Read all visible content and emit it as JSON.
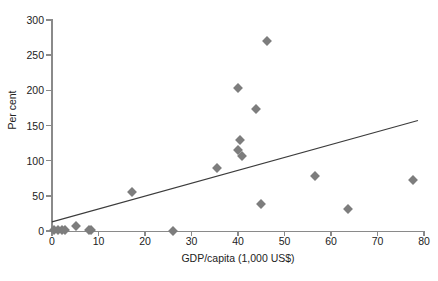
{
  "chart_data": {
    "type": "scatter",
    "title": "",
    "xlabel": "GDP/capita (1,000 US$)",
    "ylabel": "Per cent",
    "xlim": [
      0,
      80
    ],
    "ylim": [
      0,
      300
    ],
    "xticks": [
      0,
      10,
      20,
      30,
      40,
      50,
      60,
      70,
      80
    ],
    "yticks": [
      0,
      50,
      100,
      150,
      200,
      250,
      300
    ],
    "grid": false,
    "legend": "none",
    "marker_shape": "diamond",
    "marker_color": "#7d7d7d",
    "points": [
      {
        "x": 0.5,
        "y": 1
      },
      {
        "x": 1.2,
        "y": 1
      },
      {
        "x": 2.2,
        "y": 2
      },
      {
        "x": 2.8,
        "y": 2
      },
      {
        "x": 5.1,
        "y": 7
      },
      {
        "x": 7.9,
        "y": 1
      },
      {
        "x": 8.4,
        "y": 1
      },
      {
        "x": 26.1,
        "y": 0
      },
      {
        "x": 17.3,
        "y": 55
      },
      {
        "x": 35.5,
        "y": 90
      },
      {
        "x": 39.9,
        "y": 204
      },
      {
        "x": 40.5,
        "y": 129
      },
      {
        "x": 40.1,
        "y": 115
      },
      {
        "x": 40.9,
        "y": 107
      },
      {
        "x": 43.8,
        "y": 173
      },
      {
        "x": 45.0,
        "y": 39
      },
      {
        "x": 46.3,
        "y": 270
      },
      {
        "x": 56.6,
        "y": 78
      },
      {
        "x": 63.7,
        "y": 31
      },
      {
        "x": 77.6,
        "y": 72
      }
    ],
    "trend_line": {
      "label": "linear trend",
      "color": "#3c3c3c",
      "x_start": 0,
      "y_start": 13,
      "x_end": 78.7,
      "y_end": 157
    }
  },
  "axis": {
    "y_title": "Per cent",
    "x_title": "GDP/capita (1,000 US$)",
    "y_labels": [
      "300",
      "250",
      "200",
      "150",
      "100",
      "50",
      "0"
    ],
    "x_labels": [
      "0",
      "10",
      "20",
      "30",
      "40",
      "50",
      "60",
      "70",
      "80"
    ]
  }
}
